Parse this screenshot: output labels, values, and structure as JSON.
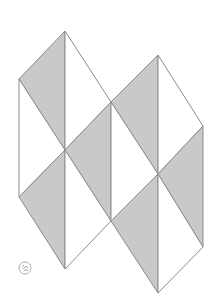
{
  "diagram": {
    "title": "",
    "colors": {
      "background": "#ffffff",
      "shaded": "#c9c9c9",
      "unshaded": "#ffffff",
      "stroke": "#8c8c8c"
    },
    "triangles": [
      {
        "points": "65,31 19,79 65,150",
        "shaded": true
      },
      {
        "points": "19,79 19,197 65,150",
        "shaded": false
      },
      {
        "points": "65,150 19,197 65,269",
        "shaded": true
      },
      {
        "points": "65,31 111,102 65,150",
        "shaded": false
      },
      {
        "points": "111,102 65,150 111,221",
        "shaded": true
      },
      {
        "points": "65,150 111,221 65,269",
        "shaded": false
      },
      {
        "points": "158,55 111,102 158,174",
        "shaded": true
      },
      {
        "points": "111,102 111,221 158,174",
        "shaded": false
      },
      {
        "points": "158,174 111,221 158,293",
        "shaded": true
      },
      {
        "points": "158,55 203,126 158,174",
        "shaded": false
      },
      {
        "points": "203,126 158,174 203,247",
        "shaded": true
      },
      {
        "points": "158,174 203,247 158,293",
        "shaded": false
      }
    ],
    "logo": {
      "label": "logo-mark",
      "cx": 25,
      "cy": 268,
      "r": 6
    }
  }
}
